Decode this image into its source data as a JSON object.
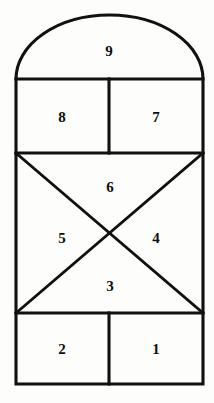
{
  "figure": {
    "name": "hopscotch-court",
    "background_color": "#fdfdfc",
    "line_color": "#111111",
    "number_color": "#0d0d0d",
    "width": 214,
    "height": 403
  },
  "cells": [
    {
      "id": "cell-9",
      "label": "9",
      "shape": "semicircle-arch",
      "x": 109,
      "y": 51
    },
    {
      "id": "cell-8",
      "label": "8",
      "shape": "rectangle",
      "x": 62,
      "y": 117
    },
    {
      "id": "cell-7",
      "label": "7",
      "shape": "rectangle",
      "x": 156,
      "y": 117
    },
    {
      "id": "cell-6",
      "label": "6",
      "shape": "triangle-top",
      "x": 110,
      "y": 187
    },
    {
      "id": "cell-5",
      "label": "5",
      "shape": "triangle-left",
      "x": 62,
      "y": 238
    },
    {
      "id": "cell-4",
      "label": "4",
      "shape": "triangle-right",
      "x": 156,
      "y": 238
    },
    {
      "id": "cell-3",
      "label": "3",
      "shape": "triangle-bottom",
      "x": 110,
      "y": 286
    },
    {
      "id": "cell-2",
      "label": "2",
      "shape": "rectangle",
      "x": 62,
      "y": 349
    },
    {
      "id": "cell-1",
      "label": "1",
      "shape": "rectangle",
      "x": 156,
      "y": 349
    }
  ],
  "geometry": {
    "left": 16,
    "right": 203,
    "arch_top": 15,
    "arch_base": 79,
    "row_87_bottom": 153,
    "xbox_bottom": 313,
    "bottom": 384,
    "mid_divider_x": 109
  }
}
